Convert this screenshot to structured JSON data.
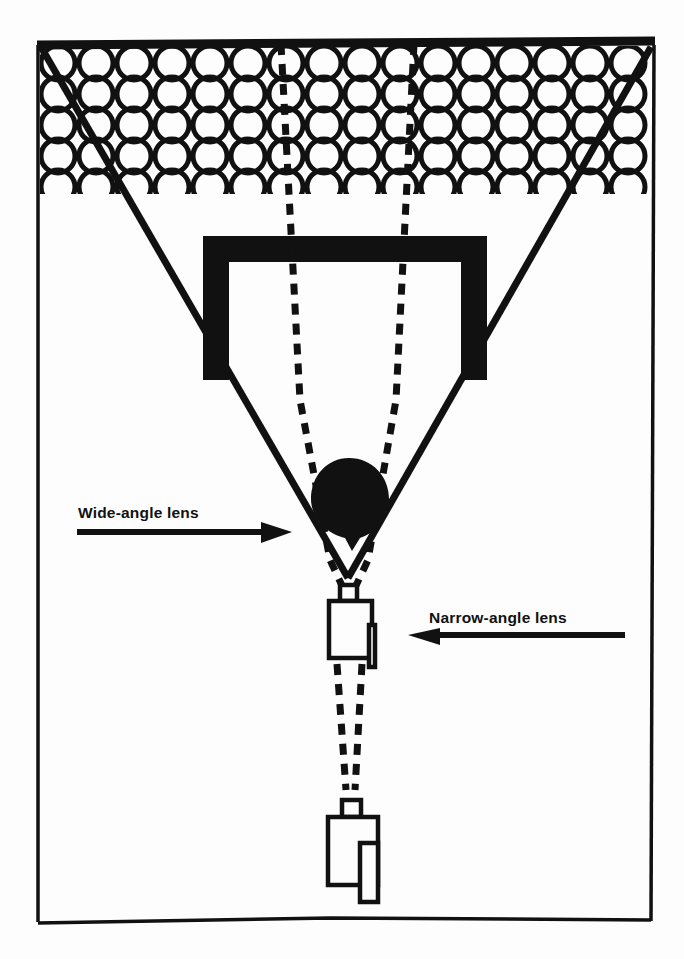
{
  "figure": {
    "name": "camera-lens-angle-of-view-diagram",
    "background_color": "#fdfdfd",
    "ink_color": "#111111",
    "width": 684,
    "height": 959
  },
  "labels": {
    "wide_angle": "Wide-angle lens",
    "narrow_angle": "Narrow-angle lens"
  },
  "elements": {
    "frame_border_name": "outer-frame-border",
    "circle_pattern_name": "background-circle-pattern",
    "doorway_name": "black-doorway-frame",
    "subject_name": "black-balloon-subject",
    "wide_camera_name": "wide-angle-camera",
    "narrow_camera_name": "narrow-angle-camera",
    "wide_cone_name": "wide-angle-field-of-view-cone",
    "narrow_cone_name": "narrow-angle-field-of-view-cone"
  },
  "pattern": {
    "circle_rows": 5,
    "circle_columns": 16,
    "circle_radius": 17,
    "stroke_width": 5
  },
  "cones": {
    "wide_angle_apex": [
      348,
      578
    ],
    "wide_angle_left_top": [
      40,
      46
    ],
    "wide_angle_right_top": [
      652,
      46
    ],
    "narrow_angle_apex": [
      352,
      806
    ],
    "narrow_angle_left_top": [
      281,
      46
    ],
    "narrow_angle_right_top": [
      414,
      46
    ]
  }
}
